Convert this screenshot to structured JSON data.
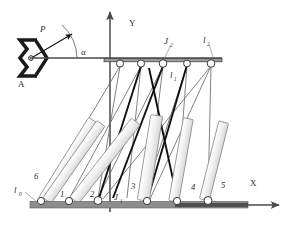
{
  "figure": {
    "type": "engineering-schematic",
    "width": 292,
    "height": 227
  },
  "colors": {
    "background": "#ffffff",
    "axis": "#4a4a4a",
    "thin_line": "#6b6b6b",
    "bold_line": "#111111",
    "link_fill_light": "#f1f1f1",
    "link_fill_mid": "#e2e2e2",
    "link_stroke": "#8a8a8a",
    "ground_rail": "#8d8d8d",
    "ground_rail_dark": "#4f4f4f",
    "joint_fill": "#ffffff",
    "joint_stroke": "#3a3a3a",
    "label_text": "#2a2a2a",
    "support_bracket": "#1a1a1a"
  },
  "axes": {
    "y_axis": {
      "label": "Y",
      "x": 110,
      "y_top": 10,
      "y_bottom": 212,
      "label_x": 130,
      "label_y": 24
    },
    "x_axis": {
      "label": "X",
      "y": 205,
      "x_left": 30,
      "x_right": 281,
      "label_x": 252,
      "label_y": 183
    }
  },
  "support": {
    "label": "A",
    "label_x": 22,
    "label_y": 84,
    "pivot_x": 30,
    "pivot_y": 58,
    "name": "fixed-revolute-support"
  },
  "force": {
    "label": "P",
    "label_x": 42,
    "label_y": 30,
    "tail_x": 31,
    "tail_y": 58,
    "head_x": 73,
    "head_y": 33,
    "angle_label": "α",
    "angle_label_x": 84,
    "angle_label_y": 52,
    "arc_radius": 46
  },
  "top_bar": {
    "x_left": 104,
    "x_right": 222,
    "y": 61,
    "thickness": 3,
    "name": "upper-horizontal-frame-bar"
  },
  "horizontal_lever": {
    "x_left": 30,
    "x_right": 222,
    "y": 58,
    "name": "lever-arm-from-support-A"
  },
  "ground_rail": {
    "x_left": 30,
    "x_right": 248,
    "y": 203,
    "height": 7,
    "dark_segment": {
      "x_left": 175,
      "x_right": 248,
      "y": 205,
      "height": 4
    },
    "name": "ground-rail"
  },
  "upper_joints": [
    {
      "id": "uj1",
      "x": 120,
      "y": 63,
      "r": 3.6
    },
    {
      "id": "uj2",
      "x": 141,
      "y": 63,
      "r": 3.6
    },
    {
      "id": "uj3",
      "x": 163,
      "y": 63,
      "r": 3.8
    },
    {
      "id": "uj4",
      "x": 187,
      "y": 63,
      "r": 3.4
    },
    {
      "id": "uj5",
      "x": 211,
      "y": 63,
      "r": 3.8
    }
  ],
  "lower_joints": [
    {
      "id": "lj0",
      "x": 41,
      "y": 201,
      "r": 3.6
    },
    {
      "id": "lj1",
      "x": 69,
      "y": 201,
      "r": 3.6
    },
    {
      "id": "lj2",
      "x": 98,
      "y": 200,
      "r": 4.0
    },
    {
      "id": "lj3",
      "x": 147,
      "y": 201,
      "r": 3.6
    },
    {
      "id": "lj4",
      "x": 177,
      "y": 201,
      "r": 3.6
    },
    {
      "id": "lj5",
      "x": 208,
      "y": 201,
      "r": 4.0
    }
  ],
  "links": [
    {
      "id": "link6",
      "label": "6",
      "label_x": 37,
      "label_y": 176,
      "x1": 43,
      "y1": 199,
      "x2": 93,
      "y2": 120,
      "width": 9
    },
    {
      "id": "link1",
      "label": "1",
      "label_x": 63,
      "label_y": 194,
      "x1": 47,
      "y1": 200,
      "x2": 100,
      "y2": 124,
      "width": 9
    },
    {
      "id": "link2",
      "label": "2",
      "label_x": 93,
      "label_y": 194,
      "x1": 74,
      "y1": 200,
      "x2": 135,
      "y2": 122,
      "width": 9
    },
    {
      "id": "link3",
      "label": "3",
      "label_x": 133,
      "label_y": 186,
      "x1": 143,
      "y1": 200,
      "x2": 157,
      "y2": 117,
      "width": 9
    },
    {
      "id": "link4",
      "label": "4",
      "label_x": 193,
      "label_y": 187,
      "x1": 174,
      "y1": 200,
      "x2": 188,
      "y2": 119,
      "width": 9
    },
    {
      "id": "link5",
      "label": "5",
      "label_x": 223,
      "label_y": 185,
      "x1": 205,
      "y1": 200,
      "x2": 223,
      "y2": 123,
      "width": 9
    }
  ],
  "labels": [
    {
      "id": "l0",
      "text": "l",
      "subscript": "0",
      "x": 17,
      "y": 190,
      "leader_x1": 27,
      "leader_y1": 192,
      "leader_x2": 39,
      "leader_y2": 204
    },
    {
      "id": "l1",
      "text": "l",
      "subscript": "1",
      "x": 173,
      "y": 75,
      "leader_x1": 0,
      "leader_y1": 0,
      "leader_x2": 0,
      "leader_y2": 0
    },
    {
      "id": "l2",
      "text": "l",
      "subscript": "2",
      "x": 206,
      "y": 40,
      "leader_x1": 210,
      "leader_y1": 44,
      "leader_x2": 212,
      "leader_y2": 58
    },
    {
      "id": "J1",
      "text": "J",
      "subscript": "1",
      "x": 117,
      "y": 197,
      "leader_x1": 0,
      "leader_y1": 0,
      "leader_x2": 0,
      "leader_y2": 0
    },
    {
      "id": "J2",
      "text": "J",
      "subscript": "2",
      "x": 168,
      "y": 41,
      "leader_x1": 172,
      "leader_y1": 45,
      "leader_x2": 165,
      "leader_y2": 58
    }
  ],
  "thin_connectors": [
    {
      "from_x": 120,
      "from_y": 66,
      "to_x": 41,
      "to_y": 199
    },
    {
      "from_x": 120,
      "from_y": 66,
      "to_x": 98,
      "to_y": 198
    },
    {
      "from_x": 141,
      "from_y": 66,
      "to_x": 127,
      "to_y": 198
    },
    {
      "from_x": 141,
      "from_y": 66,
      "to_x": 69,
      "to_y": 199
    },
    {
      "from_x": 163,
      "from_y": 66,
      "to_x": 98,
      "to_y": 198
    },
    {
      "from_x": 163,
      "from_y": 66,
      "to_x": 147,
      "to_y": 199
    },
    {
      "from_x": 187,
      "from_y": 66,
      "to_x": 177,
      "to_y": 199
    },
    {
      "from_x": 187,
      "from_y": 66,
      "to_x": 143,
      "to_y": 199
    },
    {
      "from_x": 211,
      "from_y": 66,
      "to_x": 208,
      "to_y": 199
    },
    {
      "from_x": 211,
      "from_y": 66,
      "to_x": 150,
      "to_y": 199
    },
    {
      "from_x": 211,
      "from_y": 66,
      "to_x": 103,
      "to_y": 199
    }
  ],
  "bold_connectors": [
    {
      "from_x": 141,
      "from_y": 66,
      "to_x": 99,
      "to_y": 198
    },
    {
      "from_x": 163,
      "from_y": 66,
      "to_x": 113,
      "to_y": 198
    },
    {
      "from_x": 187,
      "from_y": 65,
      "to_x": 148,
      "to_y": 198
    },
    {
      "from_x": 149,
      "from_y": 68,
      "to_x": 177,
      "to_y": 198
    }
  ]
}
